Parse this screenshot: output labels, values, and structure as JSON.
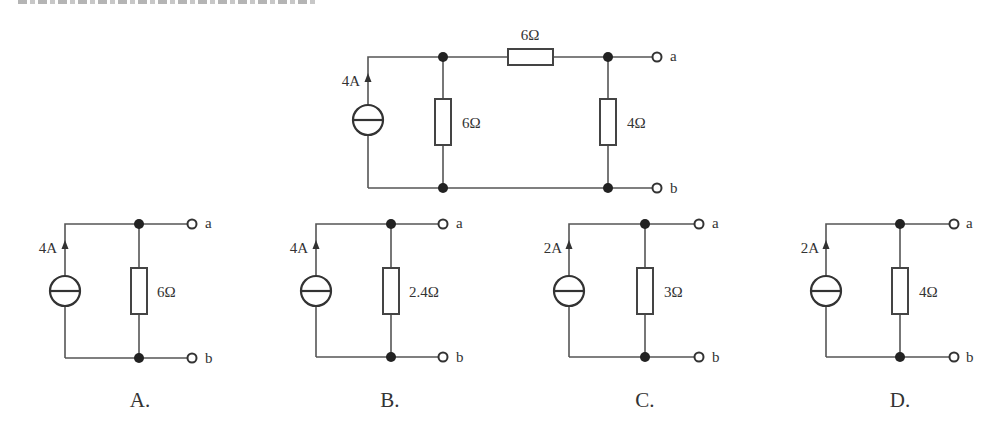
{
  "header": {
    "clipped_text": "电路的等效电流源模型为"
  },
  "main_circuit": {
    "source_current": "4A",
    "top_resistor": "6Ω",
    "left_resistor": "6Ω",
    "right_resistor": "4Ω",
    "terminal_a": "a",
    "terminal_b": "b"
  },
  "options": [
    {
      "label": "A.",
      "source_current": "4A",
      "resistor": "6Ω",
      "terminal_a": "a",
      "terminal_b": "b"
    },
    {
      "label": "B.",
      "source_current": "4A",
      "resistor": "2.4Ω",
      "terminal_a": "a",
      "terminal_b": "b"
    },
    {
      "label": "C.",
      "source_current": "2A",
      "resistor": "3Ω",
      "terminal_a": "a",
      "terminal_b": "b"
    },
    {
      "label": "D.",
      "source_current": "2A",
      "resistor": "4Ω",
      "terminal_a": "a",
      "terminal_b": "b"
    }
  ],
  "colors": {
    "background": "#ffffff",
    "line": "#444444"
  }
}
